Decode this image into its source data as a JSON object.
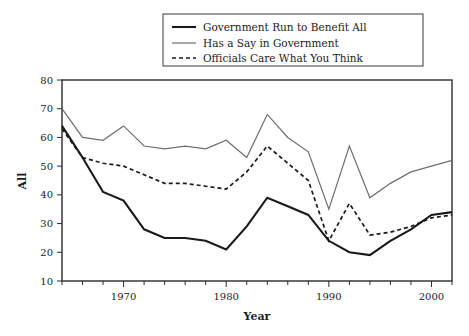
{
  "chart_data": {
    "type": "line",
    "title": "",
    "xlabel": "Year",
    "ylabel": "All",
    "xlim": [
      1964,
      2002
    ],
    "ylim": [
      10,
      80
    ],
    "grid": false,
    "legend_position": "top-center",
    "x_ticks_major": [
      1970,
      1980,
      1990,
      2000
    ],
    "x_tick_labels": [
      "1970",
      "1980",
      "1990",
      "2000"
    ],
    "x_ticks_minor": [
      1964,
      1966,
      1968,
      1972,
      1974,
      1976,
      1978,
      1982,
      1984,
      1986,
      1988,
      1992,
      1994,
      1996,
      1998,
      2002
    ],
    "y_ticks": [
      10,
      20,
      30,
      40,
      50,
      60,
      70,
      80
    ],
    "y_tick_labels": [
      "10",
      "20",
      "30",
      "40",
      "50",
      "60",
      "70",
      "80"
    ],
    "x": [
      1964,
      1966,
      1968,
      1970,
      1972,
      1974,
      1976,
      1978,
      1980,
      1982,
      1984,
      1986,
      1988,
      1990,
      1992,
      1994,
      1996,
      1998,
      2000,
      2002
    ],
    "series": [
      {
        "name": "Government Run to Benefit All",
        "style": "solid",
        "color": "#1a1a1a",
        "width": 2.1,
        "values": [
          64,
          53,
          41,
          38,
          28,
          25,
          25,
          24,
          21,
          29,
          39,
          36,
          33,
          24,
          20,
          19,
          24,
          28,
          33,
          34
        ]
      },
      {
        "name": "Has a Say in Government",
        "style": "solid",
        "color": "#6e6e6e",
        "width": 1.2,
        "values": [
          70,
          60,
          59,
          64,
          57,
          56,
          57,
          56,
          59,
          53,
          68,
          60,
          55,
          35,
          57,
          39,
          44,
          48,
          50,
          52
        ]
      },
      {
        "name": "Officials Care What You Think",
        "style": "dashed",
        "color": "#1a1a1a",
        "width": 1.7,
        "values": [
          63,
          53,
          51,
          50,
          47,
          44,
          44,
          43,
          42,
          48,
          57,
          51,
          45,
          24,
          37,
          26,
          27,
          29,
          32,
          33
        ]
      }
    ]
  },
  "legend": {
    "items": [
      {
        "label": "Government Run to Benefit All"
      },
      {
        "label": "Has a Say in Government"
      },
      {
        "label": "Officials Care What You Think"
      }
    ]
  }
}
